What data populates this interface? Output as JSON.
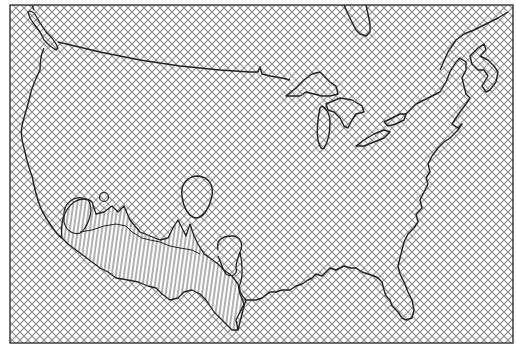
{
  "map": {
    "subject": "Continental United States outline",
    "frame": {
      "x": 10,
      "y": 5,
      "width": 503,
      "height": 338
    },
    "colors": {
      "background": "#ffffff",
      "outline": "#222222",
      "crosshatch": "#8a8a8a",
      "region_hatch": "#3a3a3a"
    },
    "fill_patterns": [
      {
        "name": "crosshatch",
        "description": "diagonal cross-hatching covering the whole map area"
      },
      {
        "name": "vertical-hatch",
        "description": "vertical line hatching for a region along the southwestern border"
      }
    ],
    "features": [
      {
        "name": "us-coastline-and-border",
        "type": "outline"
      },
      {
        "name": "great-lakes",
        "type": "outline"
      },
      {
        "name": "vancouver-island",
        "type": "outline"
      },
      {
        "name": "hudson-bay-tip",
        "type": "outline"
      },
      {
        "name": "gulf-of-st-lawrence",
        "type": "outline"
      },
      {
        "name": "florida-peninsula",
        "type": "outline"
      },
      {
        "name": "southwest-border-region",
        "type": "highlighted-region",
        "pattern": "vertical-hatch"
      },
      {
        "name": "arizona-small-circle",
        "type": "outline"
      },
      {
        "name": "new-mexico-oval",
        "type": "outline"
      },
      {
        "name": "texas-loop",
        "type": "outline"
      }
    ]
  }
}
